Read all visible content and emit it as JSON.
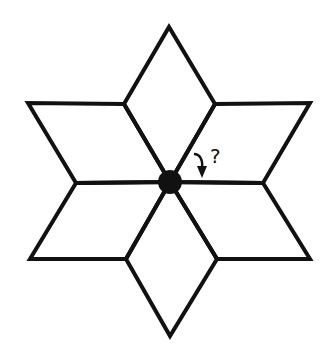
{
  "figure": {
    "stroke_color": "#111111",
    "background": "#ffffff",
    "center": {
      "x": 170,
      "y": 182,
      "radius": 12
    },
    "rhombus_count": 6,
    "annotation": {
      "label": "?",
      "arrow": "curved-arrow-down"
    }
  }
}
